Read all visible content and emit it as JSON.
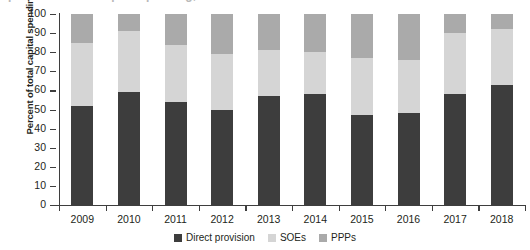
{
  "figure": {
    "title_remnant": "percent of total capital spending, by provider",
    "ylabel": "Percent of total capital spending"
  },
  "axis": {
    "y_ticks": [
      "100",
      "90",
      "80",
      "70",
      "60",
      "50",
      "40",
      "30",
      "20",
      "10",
      "0"
    ],
    "x_ticks": [
      "2009",
      "2010",
      "2011",
      "2012",
      "2013",
      "2014",
      "2015",
      "2016",
      "2017",
      "2018"
    ]
  },
  "legend": {
    "items": [
      {
        "label": "Direct provision",
        "color": "#3d3d3d"
      },
      {
        "label": "SOEs",
        "color": "#d5d5d5"
      },
      {
        "label": "PPPs",
        "color": "#aaaaaa"
      }
    ]
  },
  "colors": {
    "direct_provision": "#3d3d3d",
    "soes": "#d5d5d5",
    "ppps": "#aaaaaa",
    "axis": "#3e3e3e",
    "text": "#231f20",
    "background": "#ffffff"
  },
  "chart_data": {
    "type": "bar",
    "subtype": "stacked-bar-100-percent",
    "title": "",
    "xlabel": "",
    "ylabel": "Percent of total capital spending",
    "ylim": [
      0,
      100
    ],
    "ytick_interval": 10,
    "grid": false,
    "legend_position": "bottom-center",
    "categories": [
      "2009",
      "2010",
      "2011",
      "2012",
      "2013",
      "2014",
      "2015",
      "2016",
      "2017",
      "2018"
    ],
    "series": [
      {
        "name": "Direct provision",
        "color": "#3d3d3d",
        "values": [
          52,
          59,
          54,
          50,
          57,
          58,
          47,
          48,
          58,
          63
        ]
      },
      {
        "name": "SOEs",
        "color": "#d5d5d5",
        "values": [
          33,
          32,
          30,
          29,
          24,
          22,
          30,
          28,
          32,
          29
        ]
      },
      {
        "name": "PPPs",
        "color": "#aaaaaa",
        "values": [
          15,
          9,
          16,
          21,
          19,
          20,
          23,
          24,
          10,
          8
        ]
      }
    ],
    "cumulative_tops": {
      "direct_provision": [
        52,
        59,
        54,
        50,
        57,
        58,
        47,
        48,
        58,
        63
      ],
      "soes": [
        85,
        91,
        84,
        79,
        81,
        80,
        77,
        76,
        90,
        92
      ],
      "ppps": [
        100,
        100,
        100,
        100,
        100,
        100,
        100,
        100,
        100,
        100
      ]
    }
  }
}
